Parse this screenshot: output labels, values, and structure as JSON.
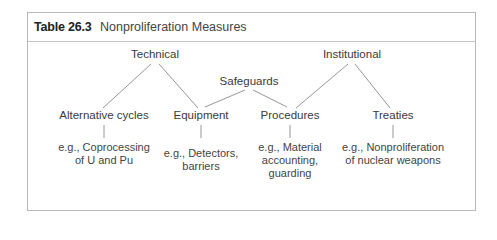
{
  "table": {
    "number": "Table 26.3",
    "title": "Nonproliferation Measures"
  },
  "diagram": {
    "top_level": [
      {
        "label": "Technical"
      },
      {
        "label": "Safeguards"
      },
      {
        "label": "Institutional"
      }
    ],
    "measures": [
      {
        "label": "Alternative cycles",
        "parent": "Technical",
        "example": [
          "e.g., Coprocessing",
          "of U and Pu"
        ]
      },
      {
        "label": "Equipment",
        "parent": "Technical / Safeguards",
        "example": [
          "e.g., Detectors,",
          "barriers"
        ]
      },
      {
        "label": "Procedures",
        "parent": "Institutional / Safeguards",
        "example": [
          "e.g., Material",
          "accounting,",
          "guarding"
        ]
      },
      {
        "label": "Treaties",
        "parent": "Institutional",
        "example": [
          "e.g., Nonproliferation",
          "of nuclear weapons"
        ]
      }
    ],
    "colors": {
      "line": "#8a8a8a",
      "border": "#b8b8b8",
      "text": "#3a3a3a"
    }
  }
}
